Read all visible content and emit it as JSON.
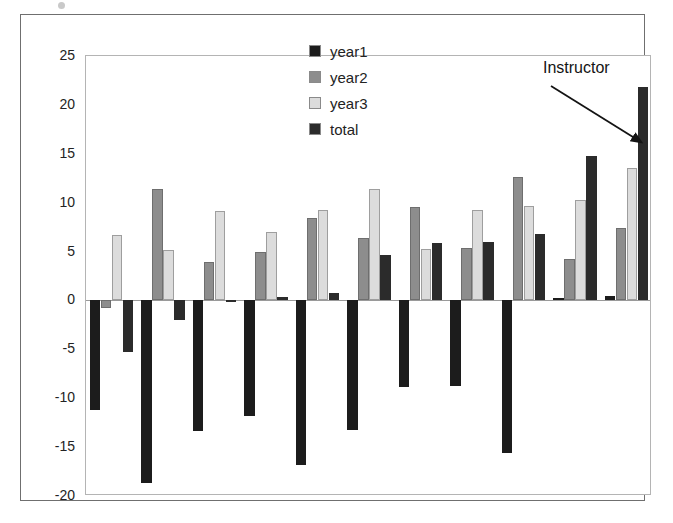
{
  "chart_data": {
    "type": "bar",
    "title": "",
    "subtitle": "",
    "xlabel": "",
    "ylabel": "",
    "ylim": [
      -20,
      25
    ],
    "ytick_step": 5,
    "yticks": [
      25,
      20,
      15,
      10,
      5,
      0,
      -5,
      -10,
      -15,
      -20
    ],
    "ytick_labels": [
      "25",
      "20",
      "15",
      "10",
      "5",
      "0",
      "-5",
      "-10",
      "-15",
      "-20"
    ],
    "grid": false,
    "legend_position": "top-center",
    "categories": [
      "1",
      "2",
      "3",
      "4",
      "5",
      "6",
      "7",
      "8",
      "9",
      "10",
      "11"
    ],
    "xtick_labels_shown": false,
    "series": [
      {
        "name": "year1",
        "color": "#1c1c1c",
        "values": [
          -11.2,
          -18.7,
          -13.4,
          -11.8,
          -16.8,
          -13.2,
          -8.9,
          -8.7,
          -15.6,
          0.2,
          0.5
        ]
      },
      {
        "name": "year2",
        "color": "#8d8d8d",
        "values": [
          -0.8,
          11.4,
          3.9,
          5.0,
          8.4,
          6.4,
          9.6,
          5.4,
          12.6,
          4.2,
          7.4
        ]
      },
      {
        "name": "year3",
        "color": "#dcdcdc",
        "values": [
          6.7,
          5.2,
          9.1,
          7.0,
          9.2,
          11.4,
          5.3,
          9.2,
          9.7,
          10.3,
          13.5
        ]
      },
      {
        "name": "total",
        "color": "#2b2b2b",
        "values": [
          -5.3,
          -2.0,
          -0.2,
          0.4,
          0.8,
          4.6,
          5.9,
          6.0,
          6.8,
          14.8,
          21.8
        ]
      }
    ],
    "annotations": [
      {
        "text": "Instructor",
        "target_group": 11,
        "target_series": "total",
        "arrow": true
      }
    ]
  },
  "legend": {
    "items": [
      {
        "label": "year1",
        "swatch": "legend-swatch-year1"
      },
      {
        "label": "year2",
        "swatch": "legend-swatch-year2"
      },
      {
        "label": "year3",
        "swatch": "legend-swatch-year3"
      },
      {
        "label": "total",
        "swatch": "legend-swatch-total"
      }
    ]
  },
  "annotation": {
    "label": "Instructor"
  },
  "colors": {
    "year1": "#1c1c1c",
    "year2": "#8d8d8d",
    "year3": "#dcdcdc",
    "total": "#2b2b2b",
    "outer_frame": "#6f6f6f",
    "plot_frame": "#b4b4b4",
    "zero_line": "#9a9a9a",
    "text": "#232323"
  }
}
